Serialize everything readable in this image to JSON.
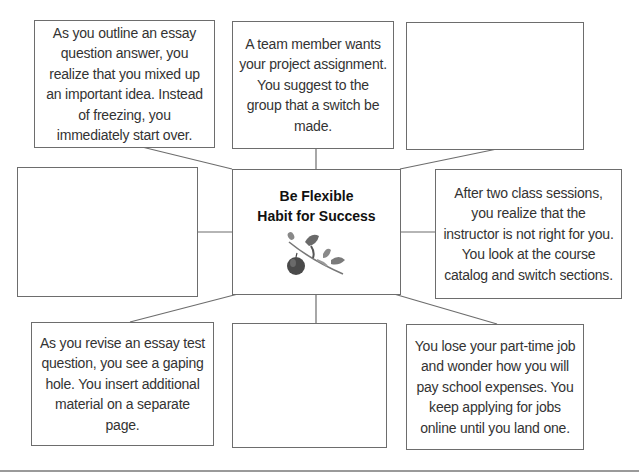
{
  "diagram": {
    "center": {
      "title_line1": "Be Flexible",
      "title_line2": "Habit for Success",
      "image": "apple-on-branch-illustration"
    },
    "boxes": {
      "top_left": "As you outline an essay question answer, you realize that you mixed up an important idea. Instead of freezing, you immediately start over.",
      "top_center": "A team member wants your project assignment. You suggest to the group that a switch be made.",
      "top_right": "",
      "middle_left": "",
      "middle_right": "After two class sessions, you realize that the instructor is not right for you. You look at the course catalog and switch sections.",
      "bottom_left": "As you revise an essay test question, you see a gaping hole. You insert  additional material on a separate page.",
      "bottom_center": "",
      "bottom_right": "You lose your part-time job and wonder how you will pay school expenses. You keep applying for jobs online until you land one."
    },
    "colors": {
      "border": "#6d6d6d",
      "text": "#333333",
      "rule": "#9a9a9a"
    }
  }
}
